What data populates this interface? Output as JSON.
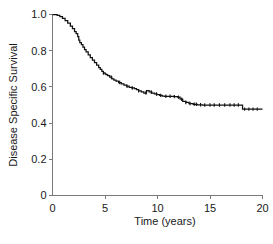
{
  "chart_data": {
    "type": "line",
    "title": "",
    "xlabel": "Time (years)",
    "ylabel": "Disease Specific Survival",
    "xlim": [
      0,
      20
    ],
    "ylim": [
      0,
      1.0
    ],
    "xticks": [
      0,
      5,
      10,
      15,
      20
    ],
    "xticklabels": [
      "0",
      "5",
      "10",
      "15",
      "20"
    ],
    "yticks": [
      0,
      0.2,
      0.4,
      0.6,
      0.8,
      1.0
    ],
    "yticklabels": [
      "0",
      "0.2",
      "0.4",
      "0.6",
      "0.8",
      "1.0"
    ],
    "grid": false,
    "legend": false,
    "curve_color": "#111111",
    "axis_color": "#7a7a7a",
    "series": [
      {
        "name": "Disease Specific Survival",
        "step": true,
        "x": [
          0.0,
          0.25,
          0.45,
          0.7,
          0.95,
          1.2,
          1.45,
          1.7,
          1.9,
          2.1,
          2.25,
          2.4,
          2.5,
          2.6,
          2.75,
          2.9,
          3.05,
          3.2,
          3.4,
          3.6,
          3.8,
          4.0,
          4.2,
          4.4,
          4.55,
          4.7,
          4.85,
          5.0,
          5.1,
          5.25,
          5.45,
          5.65,
          5.85,
          6.05,
          6.3,
          6.55,
          6.8,
          7.05,
          7.3,
          7.55,
          7.8,
          8.0,
          8.2,
          8.45,
          8.7,
          8.95,
          9.2,
          9.45,
          9.7,
          9.95,
          10.2,
          10.45,
          10.7,
          11.0,
          11.3,
          11.6,
          11.9,
          12.15,
          12.4,
          12.7,
          13.0,
          13.4,
          13.8,
          14.3,
          15.0,
          16.0,
          17.0,
          18.0,
          18.1,
          18.6,
          19.2,
          20.0
        ],
        "y": [
          1.0,
          1.0,
          0.995,
          0.988,
          0.978,
          0.966,
          0.952,
          0.936,
          0.922,
          0.906,
          0.894,
          0.878,
          0.858,
          0.845,
          0.833,
          0.82,
          0.806,
          0.793,
          0.777,
          0.762,
          0.748,
          0.734,
          0.72,
          0.707,
          0.697,
          0.686,
          0.677,
          0.672,
          0.668,
          0.662,
          0.654,
          0.645,
          0.638,
          0.632,
          0.624,
          0.617,
          0.61,
          0.604,
          0.598,
          0.594,
          0.59,
          0.585,
          0.578,
          0.572,
          0.566,
          0.58,
          0.572,
          0.566,
          0.561,
          0.557,
          0.553,
          0.549,
          0.548,
          0.548,
          0.547,
          0.546,
          0.543,
          0.532,
          0.52,
          0.514,
          0.508,
          0.504,
          0.501,
          0.5,
          0.5,
          0.5,
          0.5,
          0.5,
          0.477,
          0.477,
          0.477,
          0.477
        ]
      }
    ],
    "censor_times": [
      4.85,
      5.6,
      6.4,
      7.1,
      7.6,
      8.2,
      8.9,
      9.4,
      9.9,
      10.3,
      10.8,
      11.2,
      11.6,
      12.0,
      12.3,
      12.7,
      13.1,
      13.5,
      13.7,
      14.1,
      14.5,
      15.0,
      15.4,
      15.9,
      16.4,
      16.9,
      17.3,
      17.7,
      18.3,
      18.7,
      19.1,
      19.5
    ]
  }
}
